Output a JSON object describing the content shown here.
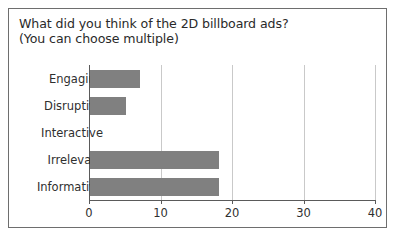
{
  "chart_data": {
    "type": "bar",
    "orientation": "horizontal",
    "title": "What did you think of the 2D billboard ads?\n(You can choose multiple)",
    "categories": [
      "Engaging",
      "Disruptive",
      "Interactive",
      "Irrelevant",
      "Informative"
    ],
    "values": [
      7,
      5,
      0,
      18,
      18
    ],
    "xlabel": "",
    "ylabel": "",
    "xlim": [
      0,
      40
    ],
    "xticks": [
      0,
      10,
      20,
      30,
      40
    ],
    "xtick_labels": [
      "0",
      "10",
      "20",
      "30",
      "40"
    ],
    "grid": true,
    "grid_axis": "x",
    "legend": false,
    "bar_color": "#808080",
    "grid_color": "#c9c9c9",
    "axis_color": "#5a5a5a",
    "text_color": "#2f2f2f",
    "frame_border_color": "#6e6e6e",
    "background": "#ffffff"
  }
}
